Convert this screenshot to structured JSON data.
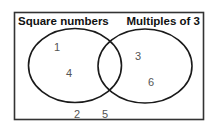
{
  "diagram": {
    "type": "venn",
    "sets": [
      {
        "label": "Square numbers",
        "only": [
          "1",
          "4"
        ]
      },
      {
        "label": "Multiples of 3",
        "only": [
          "3",
          "6"
        ]
      }
    ],
    "intersection": [],
    "outside": [
      "2",
      "5"
    ],
    "colors": {
      "stroke": "#1a1a1a",
      "numbers": "#555555",
      "background": "#ffffff"
    }
  },
  "labels": {
    "set_a": "Square numbers",
    "set_b": "Multiples of 3"
  },
  "numbers": {
    "a_1": "1",
    "a_2": "4",
    "b_1": "3",
    "b_2": "6",
    "out_1": "2",
    "out_2": "5"
  }
}
